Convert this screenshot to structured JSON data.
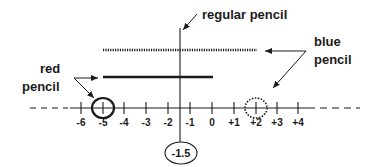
{
  "diagram": {
    "labels": {
      "regular_pencil": "regular  pencil",
      "blue_pencil_line1": "blue",
      "blue_pencil_line2": "pencil",
      "red_pencil_line1": "red",
      "red_pencil_line2": "pencil",
      "midpoint": "-1.5"
    },
    "number_line": {
      "ticks": [
        "-6",
        "-5",
        "-4",
        "-3",
        "-2",
        "-1",
        "0",
        "+1",
        "+2",
        "+3",
        "+4"
      ],
      "red_circle_at": "-5",
      "blue_circle_at": "+2",
      "vertical_marker_at": "-1.5"
    },
    "colors": {
      "ink": "#1a1a1a",
      "background": "#ffffff"
    }
  }
}
